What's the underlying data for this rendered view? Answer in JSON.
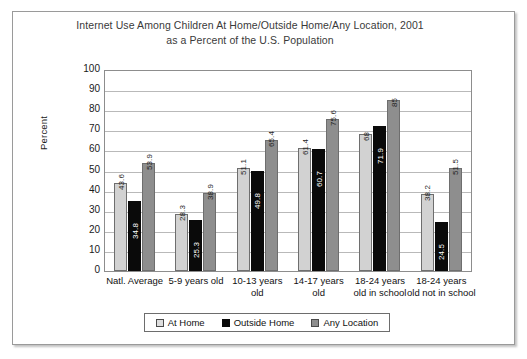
{
  "chart_data": {
    "type": "bar",
    "title": "Internet Use Among Children At Home/Outside Home/Any Location, 2001 as a Percent of the U.S. Population",
    "title_lines": [
      "Internet Use Among Children At Home/Outside Home/Any Location, 2001",
      "as a Percent of the U.S. Population"
    ],
    "xlabel": "",
    "ylabel": "Percent",
    "ylim": [
      0,
      100
    ],
    "ytick_step": 10,
    "yticks": [
      "100",
      "90",
      "80",
      "70",
      "60",
      "50",
      "40",
      "30",
      "20",
      "10",
      "0"
    ],
    "grid": true,
    "legend_position": "bottom",
    "categories": [
      "Natl. Average",
      "5-9 years old",
      "10-13 years old",
      "14-17 years old",
      "18-24 years old in school",
      "18-24 years old not in school"
    ],
    "category_lines": [
      [
        "Natl. Average"
      ],
      [
        "5-9 years old"
      ],
      [
        "10-13 years",
        "old"
      ],
      [
        "14-17 years",
        "old"
      ],
      [
        "18-24 years",
        "old in school"
      ],
      [
        "18-24 years",
        "old not in school"
      ]
    ],
    "series": [
      {
        "name": "At Home",
        "color": "#d2d2d2",
        "values": [
          43.6,
          28.3,
          51.1,
          61.4,
          68,
          38.2
        ],
        "labels": [
          "43.6",
          "28.3",
          "51.1",
          "61.4",
          "68",
          "38.2"
        ]
      },
      {
        "name": "Outside Home",
        "color": "#0a0a0a",
        "values": [
          34.8,
          25.3,
          49.8,
          60.7,
          71.9,
          24.5
        ],
        "labels": [
          "34.8",
          "25.3",
          "49.8",
          "60.7",
          "71.9",
          "24.5"
        ]
      },
      {
        "name": "Any Location",
        "color": "#8e8e8e",
        "values": [
          53.9,
          38.9,
          65.4,
          75.6,
          85,
          51.5
        ],
        "labels": [
          "53.9",
          "38.9",
          "65.4",
          "75.6",
          "85",
          "51.5"
        ]
      }
    ]
  },
  "legend": {
    "items": [
      {
        "label": "At Home"
      },
      {
        "label": "Outside Home"
      },
      {
        "label": "Any Location"
      }
    ]
  }
}
